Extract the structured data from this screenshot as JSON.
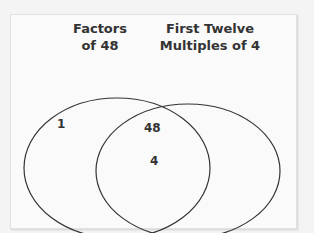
{
  "venn": {
    "left_label_line1": "Factors",
    "left_label_line2": "of 48",
    "right_label_line1": "First Twelve",
    "right_label_line2": "Multiples of 4",
    "left_only": [
      "1"
    ],
    "intersection": [
      "48",
      "4"
    ],
    "right_only": []
  }
}
